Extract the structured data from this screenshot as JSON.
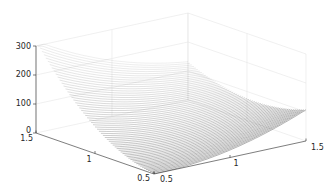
{
  "chart_data": {
    "type": "surface",
    "title": "",
    "xlabel": "",
    "ylabel": "",
    "zlabel": "",
    "x_axis": {
      "range": [
        0.5,
        1.5
      ],
      "ticks": [
        "0.5",
        "1",
        "1.5"
      ]
    },
    "y_axis": {
      "range": [
        0.5,
        1.5
      ],
      "ticks": [
        "0.5",
        "1",
        "1.5"
      ]
    },
    "z_axis": {
      "range": [
        0,
        300
      ],
      "ticks": [
        "0",
        "100",
        "200",
        "300"
      ]
    },
    "grid": true,
    "legend": "none",
    "line_color": "#404040",
    "axis_color": "#262626",
    "grid_color": "#e6e6e6"
  }
}
